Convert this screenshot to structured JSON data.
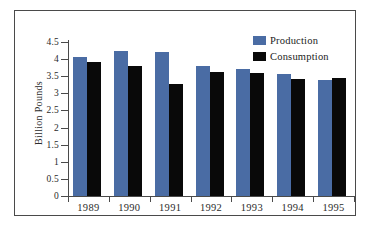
{
  "chart_data": {
    "type": "bar",
    "title": "",
    "xlabel": "",
    "ylabel": "Billion Pounds",
    "categories": [
      "1989",
      "1990",
      "1991",
      "1992",
      "1993",
      "1994",
      "1995"
    ],
    "series": [
      {
        "name": "Production",
        "color": "#4a6ca4",
        "values": [
          4.05,
          4.25,
          4.2,
          3.8,
          3.7,
          3.58,
          3.4
        ]
      },
      {
        "name": "Consumption",
        "color": "#090909",
        "values": [
          3.92,
          3.8,
          3.28,
          3.62,
          3.6,
          3.43,
          3.45
        ]
      }
    ],
    "ylim": [
      0,
      4.5
    ],
    "yticks": [
      "0",
      "0.5",
      "1",
      "1.5",
      "2",
      "2.5",
      "3",
      "3.5",
      "4",
      "4.5"
    ],
    "ytick_values": [
      0,
      0.5,
      1,
      1.5,
      2,
      2.5,
      3,
      3.5,
      4,
      4.5
    ],
    "grid": false,
    "legend_position": "top-right"
  },
  "legend": {
    "entries": [
      {
        "label": "Production",
        "color": "#4a6ca4"
      },
      {
        "label": "Consumption",
        "color": "#090909"
      }
    ]
  },
  "axis": {
    "y_title": "Billion Pounds"
  }
}
